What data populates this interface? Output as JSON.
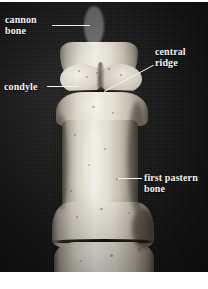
{
  "figure": {
    "type": "anatomical-photograph",
    "background_color": "#151515",
    "label_color": "#f4f2ec",
    "leader_color": "#f2f0ea"
  },
  "labels": [
    {
      "id": "cannon-bone",
      "text": "cannon\nbone",
      "position": "top-left",
      "leader": "horizontal"
    },
    {
      "id": "central-ridge",
      "text": "central\nridge",
      "position": "top-right",
      "leader": "diagonal"
    },
    {
      "id": "condyle",
      "text": "condyle",
      "position": "middle-left",
      "leader": "horizontal"
    },
    {
      "id": "first-pastern-bone",
      "text": "first pastern\nbone",
      "position": "lower-right",
      "leader": "horizontal"
    }
  ],
  "structures": [
    {
      "id": "cannon-shaft",
      "name": "cannon bone shaft"
    },
    {
      "id": "condyle-left",
      "name": "medial condyle"
    },
    {
      "id": "condyle-right",
      "name": "lateral condyle"
    },
    {
      "id": "central-ridge-groove",
      "name": "central ridge"
    },
    {
      "id": "pastern-head",
      "name": "first pastern bone proximal head"
    },
    {
      "id": "pastern-shaft",
      "name": "first pastern bone shaft"
    },
    {
      "id": "distal-segment",
      "name": "distal bone segment"
    }
  ]
}
